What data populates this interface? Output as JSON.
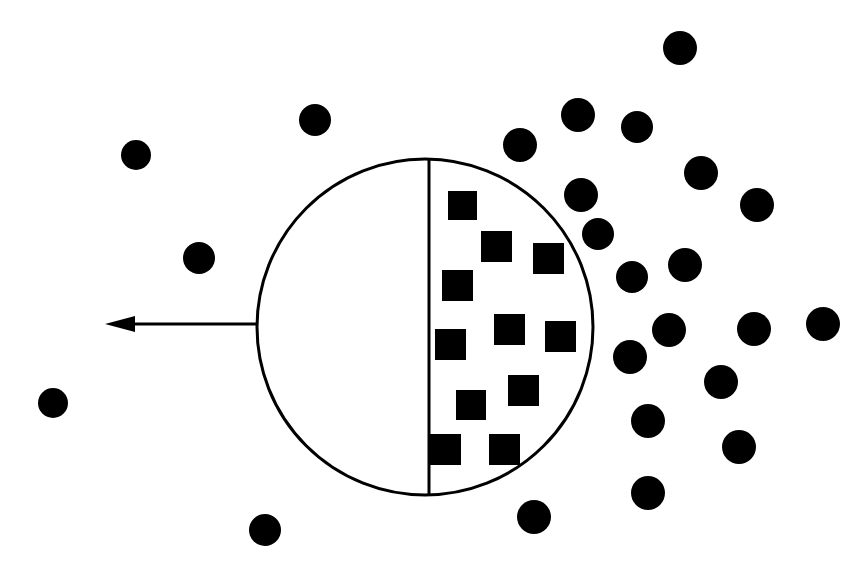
{
  "figure": {
    "canvas": {
      "width": 867,
      "height": 571,
      "background": "#ffffff"
    },
    "ink_color": "#000000"
  },
  "chart_data": {
    "type": "scatter",
    "xlabel": "",
    "ylabel": "",
    "xlim": [
      0,
      867
    ],
    "ylim": [
      0,
      571
    ],
    "grid": false,
    "legend": "none",
    "series": [
      {
        "name": "squares-inside-right-half",
        "marker": "square",
        "color": "#000000",
        "count": 11,
        "points": [
          {
            "x": 448,
            "y": 191,
            "size": 29
          },
          {
            "x": 481,
            "y": 231,
            "size": 31
          },
          {
            "x": 533,
            "y": 243,
            "size": 31
          },
          {
            "x": 442,
            "y": 270,
            "size": 31
          },
          {
            "x": 435,
            "y": 329,
            "size": 31
          },
          {
            "x": 494,
            "y": 314,
            "size": 31
          },
          {
            "x": 545,
            "y": 321,
            "size": 31
          },
          {
            "x": 508,
            "y": 375,
            "size": 31
          },
          {
            "x": 456,
            "y": 390,
            "size": 30
          },
          {
            "x": 430,
            "y": 434,
            "size": 31
          },
          {
            "x": 489,
            "y": 434,
            "size": 31
          }
        ]
      },
      {
        "name": "circles-outside",
        "marker": "circle",
        "color": "#000000",
        "count": 24,
        "points": [
          {
            "x": 136,
            "y": 155,
            "r": 15
          },
          {
            "x": 315,
            "y": 120,
            "r": 16
          },
          {
            "x": 199,
            "y": 258,
            "r": 16
          },
          {
            "x": 53,
            "y": 403,
            "r": 15
          },
          {
            "x": 265,
            "y": 530,
            "r": 16
          },
          {
            "x": 520,
            "y": 145,
            "r": 17
          },
          {
            "x": 534,
            "y": 517,
            "r": 17
          },
          {
            "x": 680,
            "y": 48,
            "r": 17
          },
          {
            "x": 578,
            "y": 115,
            "r": 17
          },
          {
            "x": 637,
            "y": 127,
            "r": 16
          },
          {
            "x": 701,
            "y": 173,
            "r": 17
          },
          {
            "x": 581,
            "y": 195,
            "r": 17
          },
          {
            "x": 757,
            "y": 205,
            "r": 17
          },
          {
            "x": 685,
            "y": 265,
            "r": 17
          },
          {
            "x": 632,
            "y": 277,
            "r": 16
          },
          {
            "x": 669,
            "y": 330,
            "r": 17
          },
          {
            "x": 630,
            "y": 357,
            "r": 17
          },
          {
            "x": 754,
            "y": 329,
            "r": 17
          },
          {
            "x": 823,
            "y": 324,
            "r": 17
          },
          {
            "x": 721,
            "y": 382,
            "r": 17
          },
          {
            "x": 648,
            "y": 421,
            "r": 17
          },
          {
            "x": 739,
            "y": 447,
            "r": 17
          },
          {
            "x": 648,
            "y": 493,
            "r": 17
          },
          {
            "x": 598,
            "y": 234,
            "r": 16
          }
        ]
      }
    ],
    "annotations": [
      {
        "name": "boundary-circle",
        "shape": "circle",
        "cx": 425,
        "cy": 327,
        "r": 168,
        "fill": "none",
        "stroke": "#000000",
        "stroke_width": 3
      },
      {
        "name": "divider-line",
        "shape": "line",
        "x1": 429,
        "y1": 158,
        "x2": 429,
        "y2": 496,
        "stroke": "#000000",
        "stroke_width": 3
      },
      {
        "name": "flow-arrow",
        "shape": "arrow",
        "direction": "left",
        "x1": 258,
        "y1": 324,
        "x2": 105,
        "y2": 324,
        "stroke": "#000000",
        "stroke_width": 3,
        "head_length": 30,
        "head_half_width": 8
      }
    ]
  }
}
